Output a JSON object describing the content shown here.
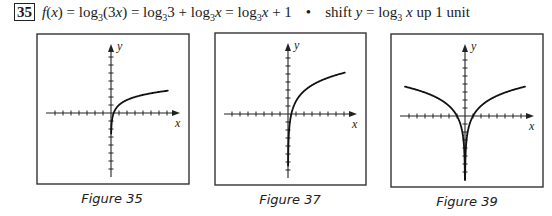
{
  "header": {
    "problem_number": "35",
    "equation_parts": {
      "lhs": "f(x)",
      "step1": "log₃(3x)",
      "step2": "log₃3 + log₃x",
      "step3": "log₃x + 1"
    },
    "bullet": "•",
    "note": "shift y = log₃ x up 1 unit"
  },
  "figures": [
    {
      "caption": "Figure 35",
      "x_axis_label": "x",
      "y_axis_label": "y",
      "function": "y = log_3(x) + 1",
      "tick_spacing_px": 8,
      "ticks_each_side": 7
    },
    {
      "caption": "Figure 37",
      "x_axis_label": "x",
      "y_axis_label": "y",
      "function": "y = log-type curve, vertical asymptote at x=0, steeper rise",
      "tick_spacing_px": 8,
      "ticks_each_side": 7
    },
    {
      "caption": "Figure 39",
      "x_axis_label": "x",
      "y_axis_label": "y",
      "function": "y = log_3|x| type, symmetric about y-axis",
      "tick_spacing_px": 8,
      "ticks_each_side": 7
    }
  ]
}
